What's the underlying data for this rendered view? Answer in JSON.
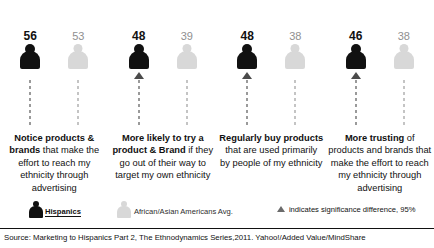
{
  "chart_data": {
    "type": "bar",
    "title": "",
    "xlabel": "",
    "ylabel": "",
    "categories": [
      "Notice products & brands that make the effort to reach my ethnicity through advertising",
      "More likely to try a product & Brand if they go out of their way to target my own ethnicity",
      "Regularly buy products that are used primarily by people of my ethnicity",
      "More trusting of products and brands that make the effort to reach my ethnicity through advertising"
    ],
    "series": [
      {
        "name": "Hispanics",
        "values": [
          56,
          48,
          48,
          46
        ],
        "color": "#111111"
      },
      {
        "name": "African/Asian Americans Avg.",
        "values": [
          53,
          39,
          38,
          38
        ],
        "color": "#d8d8d8"
      }
    ],
    "significance": [
      false,
      true,
      true,
      true
    ],
    "legend_position": "bottom",
    "grid": false
  },
  "columns": [
    {
      "dark_value": "56",
      "light_value": "53",
      "significant": false,
      "caption_bold": "Notice products & brands",
      "caption_rest": " that make the effort to reach my ethnicity through advertising"
    },
    {
      "dark_value": "48",
      "light_value": "39",
      "significant": true,
      "caption_bold": "More likely to try a product & Brand",
      "caption_rest": " if they go out of their way to target my own ethnicity"
    },
    {
      "dark_value": "48",
      "light_value": "38",
      "significant": true,
      "caption_bold": "Regularly buy products",
      "caption_rest": " that are used primarily by people of my ethnicity"
    },
    {
      "dark_value": "46",
      "light_value": "38",
      "significant": true,
      "caption_bold": "More trusting",
      "caption_rest": " of products and brands that make the effort to reach my ethnicity through advertising"
    }
  ],
  "legend": {
    "hispanics_label": "Hispanics",
    "other_label": "African/Asian Americans Avg.",
    "significance_label": "indicates significance difference, 95%"
  },
  "source": {
    "text": "Source: Marketing to Hispanics Part 2, The Ethnodynamics Series,2011. Yahoo!/Added Value/MindShare"
  }
}
